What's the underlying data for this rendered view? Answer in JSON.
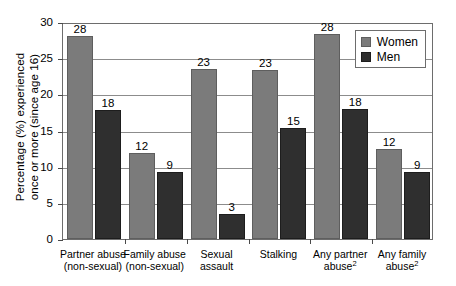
{
  "chart_data": {
    "type": "bar",
    "title": "",
    "xlabel": "",
    "ylabel_line1": "Percentage (%) experienced",
    "ylabel_line2": "once or more (since age 16)",
    "ylim": [
      0,
      30
    ],
    "yticks": [
      0,
      5,
      10,
      15,
      20,
      25,
      30
    ],
    "ytick_labels": [
      "0",
      "5",
      "10",
      "15",
      "20",
      "25",
      "30"
    ],
    "grid": true,
    "legend_position": "top-right",
    "categories": [
      "Partner abuse (non-sexual)",
      "Family abuse (non-sexual)",
      "Sexual assault",
      "Stalking",
      "Any partner abuse2",
      "Any family abuse2"
    ],
    "category_lines": [
      [
        "Partner abuse",
        "(non-sexual)"
      ],
      [
        "Family abuse",
        "(non-sexual)"
      ],
      [
        "Sexual",
        "assault"
      ],
      [
        "Stalking",
        ""
      ],
      [
        "Any partner",
        "abuse"
      ],
      [
        "Any family",
        "abuse"
      ]
    ],
    "category_footnotes": [
      "",
      "",
      "",
      "",
      "2",
      "2"
    ],
    "series": [
      {
        "name": "Women",
        "color": "#7b7b7b",
        "values": [
          28.0,
          11.9,
          23.5,
          23.4,
          28.4,
          12.5
        ],
        "labels": [
          "28",
          "12",
          "23",
          "23",
          "28",
          "12"
        ]
      },
      {
        "name": "Men",
        "color": "#2f2f2f",
        "values": [
          17.9,
          9.3,
          3.4,
          15.3,
          18.0,
          9.2
        ],
        "labels": [
          "18",
          "9",
          "3",
          "15",
          "18",
          "9"
        ]
      }
    ]
  },
  "legend": {
    "items": [
      {
        "label": "Women",
        "color": "#7b7b7b"
      },
      {
        "label": "Men",
        "color": "#2f2f2f"
      }
    ]
  }
}
